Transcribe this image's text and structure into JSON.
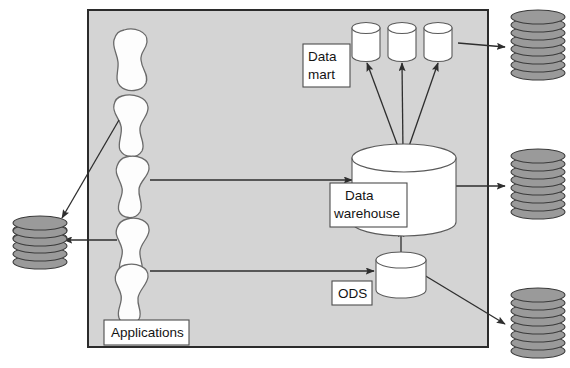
{
  "diagram": {
    "colors": {
      "panel_fill": "#d4d4d4",
      "panel_stroke": "#2b2b2b",
      "disk_fill": "#9a9a9a",
      "disk_stroke": "#3a3a3a",
      "cylinder_fill": "#ffffff",
      "cylinder_stroke": "#5a5a5a",
      "blob_fill": "#fdfdfd",
      "blob_stroke": "#6a6a6a",
      "arrow_color": "#2e2e2e",
      "label_box_fill": "#ffffff",
      "label_box_stroke": "#4d4d4d",
      "text_color": "#141414",
      "background": "#ffffff"
    },
    "labels": {
      "applications": "Applications",
      "data_mart_line1": "Data",
      "data_mart_line2": "mart",
      "data_warehouse_line1": "Data",
      "data_warehouse_line2": "warehouse",
      "ods": "ODS"
    },
    "applications": {
      "count": 5,
      "shape": "blob"
    },
    "data_marts": {
      "count": 3,
      "shape": "cylinder"
    },
    "data_warehouse": {
      "count": 1,
      "shape": "cylinder-large"
    },
    "ods": {
      "count": 1,
      "shape": "cylinder-small"
    },
    "disk_stacks": {
      "count": 4,
      "disks_per_stack": 7,
      "positions": [
        "left-middle",
        "right-top",
        "right-middle",
        "right-bottom"
      ]
    },
    "arrows": [
      {
        "name": "application-to-left-disk-stack-diagonal",
        "from": "application-2",
        "to": "disk-stack-left"
      },
      {
        "name": "application-to-left-disk-stack-horizontal",
        "from": "application-4",
        "to": "disk-stack-left"
      },
      {
        "name": "application-to-data-warehouse",
        "from": "application-3",
        "to": "data-warehouse"
      },
      {
        "name": "application-to-ods",
        "from": "application-5",
        "to": "ods"
      },
      {
        "name": "ods-to-data-warehouse",
        "from": "ods",
        "to": "data-warehouse"
      },
      {
        "name": "data-warehouse-to-data-mart-1",
        "from": "data-warehouse",
        "to": "data-mart-1"
      },
      {
        "name": "data-warehouse-to-data-mart-2",
        "from": "data-warehouse",
        "to": "data-mart-2"
      },
      {
        "name": "data-warehouse-to-data-mart-3",
        "from": "data-warehouse",
        "to": "data-mart-3"
      },
      {
        "name": "data-mart-3-to-disk-stack-right-top",
        "from": "data-mart-3",
        "to": "disk-stack-right-top"
      },
      {
        "name": "data-warehouse-to-disk-stack-right-middle",
        "from": "data-warehouse",
        "to": "disk-stack-right-middle"
      },
      {
        "name": "ods-to-disk-stack-right-bottom",
        "from": "ods",
        "to": "disk-stack-right-bottom"
      }
    ]
  }
}
